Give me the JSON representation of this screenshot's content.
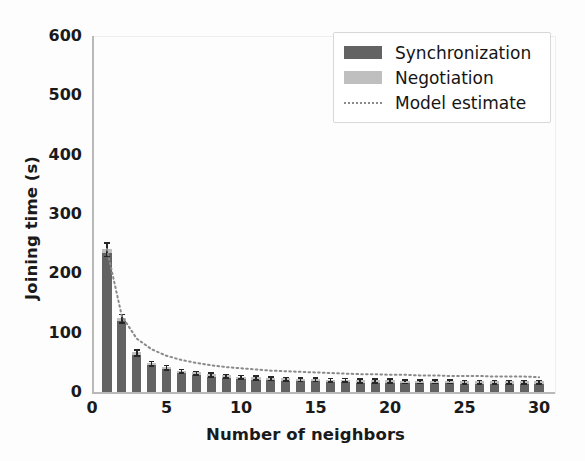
{
  "chart_data": {
    "type": "bar",
    "title": "",
    "xlabel": "Number of neighbors",
    "ylabel": "Joining time (s)",
    "xlim": [
      0,
      31
    ],
    "ylim": [
      0,
      600
    ],
    "xticks": [
      0,
      5,
      10,
      15,
      20,
      25,
      30
    ],
    "yticks": [
      0,
      100,
      200,
      300,
      400,
      500,
      600
    ],
    "grid": false,
    "legend_position": "upper right",
    "stacked": true,
    "categories": [
      1,
      2,
      3,
      4,
      5,
      6,
      7,
      8,
      9,
      10,
      11,
      12,
      13,
      14,
      15,
      16,
      17,
      18,
      19,
      20,
      21,
      22,
      23,
      24,
      25,
      26,
      27,
      28,
      29,
      30
    ],
    "series": [
      {
        "name": "Synchronization",
        "color": "#636363",
        "values": [
          235,
          120,
          63,
          45,
          38,
          32,
          29,
          26,
          24,
          22,
          21,
          20,
          19,
          18,
          18,
          17,
          17,
          16,
          16,
          16,
          15,
          15,
          15,
          15,
          14,
          14,
          14,
          14,
          14,
          14
        ]
      },
      {
        "name": "Negotiation",
        "color": "#bfbfbf",
        "values": [
          6,
          5,
          4,
          4,
          4,
          4,
          4,
          4,
          4,
          4,
          4,
          4,
          4,
          4,
          4,
          4,
          4,
          4,
          4,
          4,
          4,
          4,
          4,
          4,
          4,
          4,
          4,
          4,
          4,
          4
        ]
      }
    ],
    "errors": [
      11,
      7,
      5,
      4,
      4,
      3,
      3,
      3,
      3,
      3,
      3,
      3,
      3,
      3,
      3,
      3,
      3,
      3,
      3,
      3,
      3,
      3,
      3,
      3,
      3,
      3,
      3,
      3,
      3,
      3
    ],
    "model_estimate": {
      "name": "Model estimate",
      "color": "#8a8a8a",
      "style": "dotted",
      "x": [
        1,
        2,
        3,
        4,
        5,
        6,
        7,
        8,
        9,
        10,
        11,
        12,
        13,
        14,
        15,
        16,
        17,
        18,
        19,
        20,
        21,
        22,
        23,
        24,
        25,
        26,
        27,
        28,
        29,
        30
      ],
      "y": [
        241,
        128,
        90,
        72,
        61,
        54,
        49,
        45,
        42,
        40,
        38,
        36,
        35,
        34,
        33,
        32,
        31,
        30,
        30,
        29,
        29,
        28,
        28,
        27,
        27,
        27,
        26,
        26,
        26,
        25
      ]
    },
    "legend": [
      {
        "label": "Synchronization",
        "kind": "patch",
        "color": "#636363"
      },
      {
        "label": "Negotiation",
        "kind": "patch",
        "color": "#bfbfbf"
      },
      {
        "label": "Model estimate",
        "kind": "dotted-line",
        "color": "#8a8a8a"
      }
    ]
  }
}
